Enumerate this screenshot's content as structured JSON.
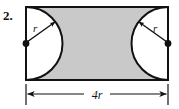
{
  "figure": {
    "problem_number": "2.",
    "shaded_region_color": "#c9c9c9",
    "outline_color": "#111111",
    "background_color": "#ffffff",
    "notch_fill_color": "#ffffff"
  },
  "labels": {
    "radius_left": "r",
    "radius_right": "r",
    "width_dimension": "4r"
  },
  "geometry": {
    "rectangle": {
      "x": 26,
      "y": 7,
      "width": 142,
      "height": 73,
      "stroke_width": 2
    },
    "semicircle_left": {
      "center_x": 26,
      "center_y": 43.5,
      "radius": 36.5
    },
    "semicircle_right": {
      "center_x": 168,
      "center_y": 43.5,
      "radius": 36.5
    },
    "dot_left": {
      "cx": 26,
      "cy": 43.5,
      "r": 3.4
    },
    "dot_right": {
      "cx": 168,
      "cy": 43.5,
      "r": 3.4
    },
    "radius_arrow_left": {
      "x1": 27,
      "y1": 42,
      "x2": 55,
      "y2": 22
    },
    "radius_arrow_right": {
      "x1": 167,
      "y1": 42,
      "x2": 139,
      "y2": 22
    },
    "dimension_line": {
      "y": 94,
      "x_start": 26,
      "x_end": 168
    },
    "extension_tick_left": {
      "x": 26,
      "y_top": 84,
      "y_bottom": 105
    },
    "extension_tick_right": {
      "x": 168,
      "y_top": 84,
      "y_bottom": 105
    }
  },
  "label_positions": {
    "problem_number": {
      "x": 3,
      "y": 20,
      "font_size": 13
    },
    "radius_left": {
      "x": 33,
      "y": 32,
      "font_size": 11
    },
    "radius_right": {
      "x": 153,
      "y": 32,
      "font_size": 11
    },
    "width_dimension": {
      "x": 90,
      "y": 99,
      "font_size": 12
    }
  }
}
